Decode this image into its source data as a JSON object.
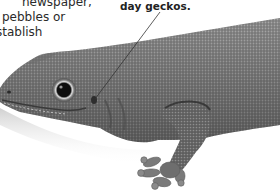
{
  "page": {
    "body_text_lines": [
      "newspaper,",
      "pebbles or",
      "stablish",
      "i"
    ],
    "callout": {
      "label": "day geckos."
    },
    "photo": {
      "subject": "gecko",
      "description": "Grayscale close-up photograph of a day gecko's head, body and front foot"
    }
  },
  "colors": {
    "background": "#ffffff",
    "text": "#2a2a2a",
    "callout_text": "#222222",
    "leader_line": "#333333",
    "gecko_dark": "#4a4a4a",
    "gecko_mid": "#7a7a7a",
    "gecko_light": "#a8a8a8"
  }
}
